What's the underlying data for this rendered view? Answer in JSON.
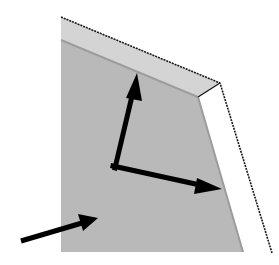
{
  "diagram": {
    "colors": {
      "background": "#ffffff",
      "face": "#b9b9b9",
      "bevel": "#d2d2d2",
      "bevel_shadow": "#a2a2a2",
      "outline": "#1a1a1a",
      "arrow": "#000000"
    },
    "arrows": [
      {
        "name": "up-arrow",
        "from": [
          115,
          166
        ],
        "to": [
          137,
          75
        ]
      },
      {
        "name": "right-arrow",
        "from": [
          115,
          166
        ],
        "to": [
          220,
          189
        ]
      },
      {
        "name": "incoming-arrow",
        "from": [
          21,
          240
        ],
        "to": [
          97,
          218
        ]
      }
    ]
  }
}
